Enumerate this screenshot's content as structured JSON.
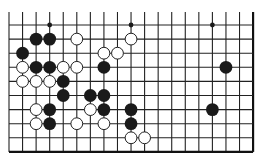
{
  "board": {
    "title": "Go board diagram (partial, bottom-right edges)",
    "columns": 19,
    "rows": 10,
    "origin_x": 9,
    "origin_y": 25,
    "spacing_x": 13.56,
    "spacing_y": 14.1,
    "top_extension_y": 12,
    "line_color": "#222222",
    "edge_color": "#111111",
    "background": "#ffffff",
    "edges": {
      "top": false,
      "left": false,
      "right": true,
      "bottom": true
    }
  },
  "colors": {
    "black_stone": "#1a1a1a",
    "white_stone_fill": "#ffffff",
    "white_stone_stroke": "#222222",
    "star_point": "#1a1a1a"
  },
  "star_points": [
    {
      "col": 3,
      "row": 0
    },
    {
      "col": 9,
      "row": 0
    },
    {
      "col": 15,
      "row": 0
    }
  ],
  "stones": [
    {
      "color": "black",
      "col": 2,
      "row": 1
    },
    {
      "color": "black",
      "col": 3,
      "row": 1
    },
    {
      "color": "white",
      "col": 5,
      "row": 1
    },
    {
      "color": "white",
      "col": 9,
      "row": 1
    },
    {
      "color": "black",
      "col": 1,
      "row": 2
    },
    {
      "color": "white",
      "col": 7,
      "row": 2
    },
    {
      "color": "white",
      "col": 8,
      "row": 2
    },
    {
      "color": "white",
      "col": 1,
      "row": 3
    },
    {
      "color": "black",
      "col": 2,
      "row": 3
    },
    {
      "color": "black",
      "col": 3,
      "row": 3
    },
    {
      "color": "white",
      "col": 4,
      "row": 3
    },
    {
      "color": "white",
      "col": 5,
      "row": 3
    },
    {
      "color": "black",
      "col": 7,
      "row": 3
    },
    {
      "color": "black",
      "col": 16,
      "row": 3
    },
    {
      "color": "white",
      "col": 1,
      "row": 4
    },
    {
      "color": "white",
      "col": 2,
      "row": 4
    },
    {
      "color": "white",
      "col": 3,
      "row": 4
    },
    {
      "color": "black",
      "col": 4,
      "row": 4
    },
    {
      "color": "black",
      "col": 4,
      "row": 5
    },
    {
      "color": "black",
      "col": 6,
      "row": 5
    },
    {
      "color": "black",
      "col": 7,
      "row": 5
    },
    {
      "color": "white",
      "col": 2,
      "row": 6
    },
    {
      "color": "black",
      "col": 3,
      "row": 6
    },
    {
      "color": "white",
      "col": 6,
      "row": 6
    },
    {
      "color": "black",
      "col": 7,
      "row": 6
    },
    {
      "color": "black",
      "col": 9,
      "row": 6
    },
    {
      "color": "black",
      "col": 15,
      "row": 6
    },
    {
      "color": "white",
      "col": 2,
      "row": 7
    },
    {
      "color": "black",
      "col": 3,
      "row": 7
    },
    {
      "color": "white",
      "col": 5,
      "row": 7
    },
    {
      "color": "white",
      "col": 7,
      "row": 7
    },
    {
      "color": "black",
      "col": 9,
      "row": 7
    },
    {
      "color": "white",
      "col": 9,
      "row": 8
    },
    {
      "color": "white",
      "col": 10,
      "row": 8
    }
  ]
}
